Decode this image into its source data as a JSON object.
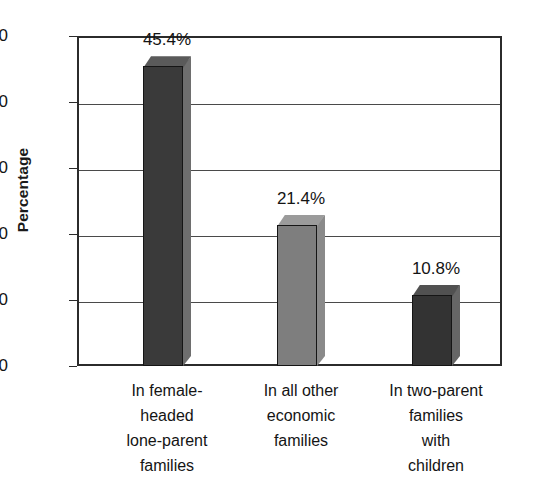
{
  "chart_data": {
    "type": "bar",
    "title": "",
    "subtitle": "",
    "xlabel": "",
    "ylabel": "Percentage",
    "ylim": [
      0,
      50
    ],
    "ytick_values": [
      0,
      10,
      20,
      30,
      40,
      50
    ],
    "ytick_labels": [
      "0",
      "10",
      "20",
      "30",
      "40",
      "50"
    ],
    "grid": true,
    "legend": "none",
    "style": "3d-bars-grayscale",
    "categories": [
      "In female-headed lone-parent families",
      "In all other economic families",
      "In two-parent families with children"
    ],
    "category_lines": [
      [
        "In female-",
        "headed",
        "lone-parent",
        "families"
      ],
      [
        "In all other",
        "economic",
        "families"
      ],
      [
        "In two-parent",
        "families",
        "with",
        "children"
      ]
    ],
    "values": [
      45.4,
      21.4,
      10.8
    ],
    "value_labels": [
      "45.4%",
      "21.4%",
      "10.8%"
    ],
    "bar_colors": [
      "#3a3a3a",
      "#7e7e7e",
      "#333333"
    ],
    "bar_top_colors": [
      "#5a5a5a",
      "#9b9b9b",
      "#515151"
    ],
    "bar_side_colors": [
      "#6e6e6e",
      "#8a8a8a",
      "#666666"
    ],
    "axis_color": "#2b2b2b",
    "gridline_color": "#4a4a4a",
    "text_color": "#141414",
    "background": "#ffffff"
  }
}
